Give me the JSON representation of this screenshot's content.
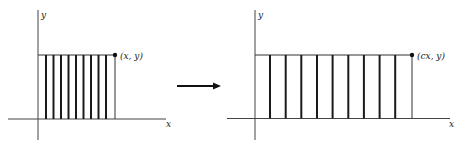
{
  "left_figure": {
    "y_axis_label": "y",
    "x_axis_label": "x",
    "point_label": "(x, y)",
    "bar_count": 9
  },
  "right_figure": {
    "y_axis_label": "y",
    "x_axis_label": "x",
    "point_label": "(cx, y)",
    "bar_count": 9
  },
  "transform_arrow": "right-arrow",
  "colors": {
    "ink": "#1a1a1a",
    "axis": "#444444",
    "background": "#ffffff"
  }
}
